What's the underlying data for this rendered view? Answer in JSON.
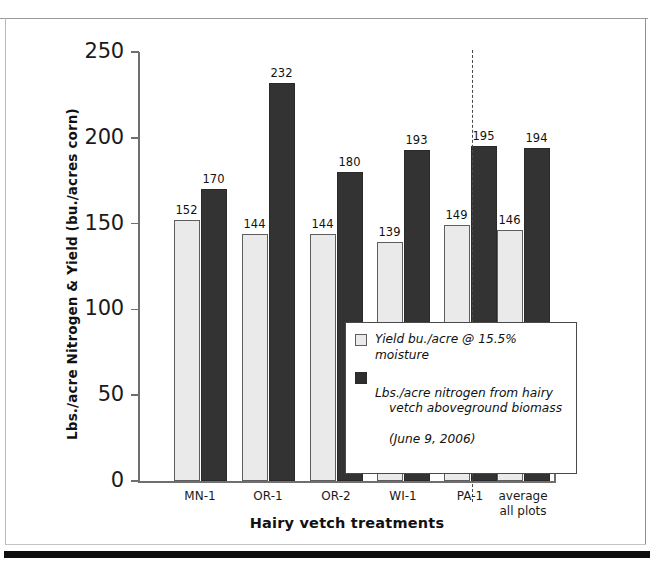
{
  "figure": {
    "background": "#ffffff",
    "frame_color": "#0d0d0d"
  },
  "chart_data": {
    "type": "bar",
    "title": "",
    "xlabel": "Hairy vetch treatments",
    "ylabel": "Lbs./acre Nitrogen & Yield (bu./acres corn)",
    "categories": [
      "MN-1",
      "OR-1",
      "OR-2",
      "WI-1",
      "PA-1",
      "average\nall plots"
    ],
    "series": [
      {
        "name": "Yield bu./acre @ 15.5% moisture",
        "color": "#eaeaea",
        "values": [
          152,
          144,
          144,
          139,
          149,
          146
        ]
      },
      {
        "name": "Lbs./acre nitrogen from hairy vetch aboveground biomass (June 9, 2006)",
        "color": "#333333",
        "values": [
          170,
          232,
          180,
          193,
          195,
          194
        ]
      }
    ],
    "ylim": [
      0,
      250
    ],
    "yticks": [
      0,
      50,
      100,
      150,
      200,
      250
    ],
    "ytick_labels": [
      "0",
      "50",
      "100",
      "150",
      "200",
      "250"
    ],
    "grid": false,
    "legend_position": "center-right",
    "annotations": {
      "group_divider": "dashed vertical line separating plot treatments from average"
    }
  },
  "legend": {
    "entries": [
      {
        "swatch": "light",
        "line1": "Yield bu./acre @ 15.5% moisture",
        "line2": "",
        "line3": ""
      },
      {
        "swatch": "dark",
        "line1": "Lbs./acre nitrogen from hairy",
        "line2": "vetch aboveground biomass",
        "line3": "(June 9, 2006)"
      }
    ]
  }
}
